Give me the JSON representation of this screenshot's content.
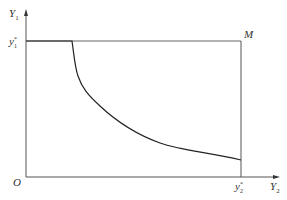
{
  "diagram": {
    "y_axis_label": "Y",
    "y_axis_sub": "1",
    "x_axis_label": "Y",
    "x_axis_sub": "2",
    "origin_label": "O",
    "y_marker_label": "y",
    "y_marker_sub": "1",
    "y_marker_sup": "*",
    "x_marker_label": "y",
    "x_marker_sub": "2",
    "x_marker_sup": "*",
    "corner_label": "M",
    "line_color": "#333333",
    "frame_color": "#555555"
  }
}
